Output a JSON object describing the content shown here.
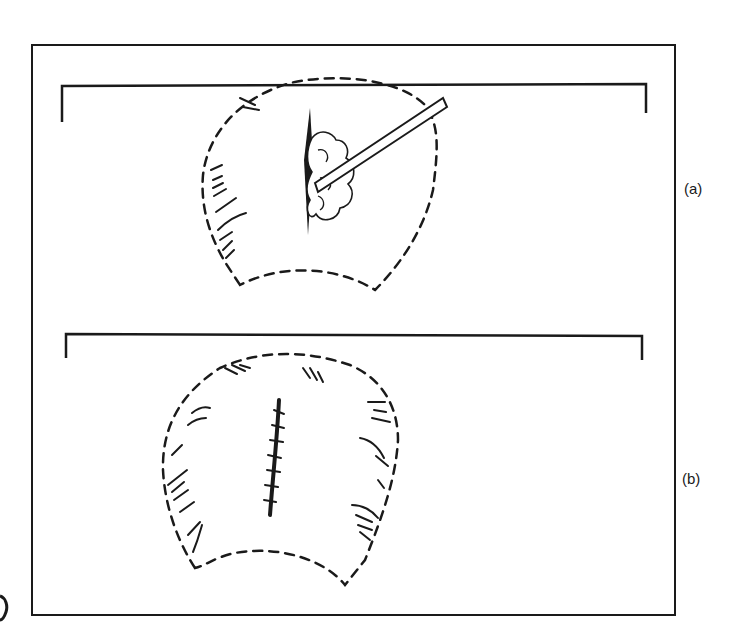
{
  "figure": {
    "panels": [
      {
        "id": "a",
        "label": "(a)",
        "description": "Dashed outline of tissue flap with incision and probe/instrument inserted into clustered tissue"
      },
      {
        "id": "b",
        "label": "(b)",
        "description": "Dashed outline of tissue flap with sutured linear incision"
      }
    ],
    "colors": {
      "ink": "#1a1a1a",
      "background": "#ffffff"
    }
  }
}
